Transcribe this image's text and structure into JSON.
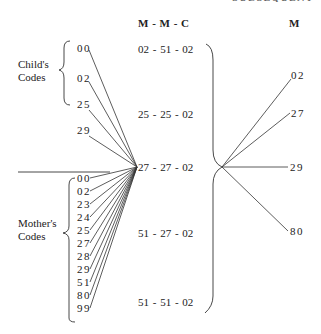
{
  "header": {
    "top_cut_text": "SUBSEQUENT MMM",
    "triple_header": "M  -  M  -  C",
    "right_header": "M"
  },
  "left": {
    "child_label": [
      "Child's",
      "Codes"
    ],
    "child_codes": [
      "00",
      "02",
      "25",
      "29"
    ],
    "mother_label": [
      "Mother's",
      "Codes"
    ],
    "mother_codes": [
      "00",
      "02",
      "23",
      "24",
      "25",
      "27",
      "28",
      "29",
      "51",
      "80",
      "99"
    ]
  },
  "middle": {
    "triples": [
      "02 - 51 - 02",
      "25 - 25 - 02",
      "27 - 27 - 02",
      "51 - 27 - 02",
      "51 - 51 - 02"
    ],
    "highlighted_triple": "27 - 27 - 02"
  },
  "right": {
    "codes": [
      "02",
      "27",
      "29",
      "80"
    ]
  },
  "colors": {
    "line": "#333333",
    "text": "#222222",
    "background": "#ffffff"
  }
}
